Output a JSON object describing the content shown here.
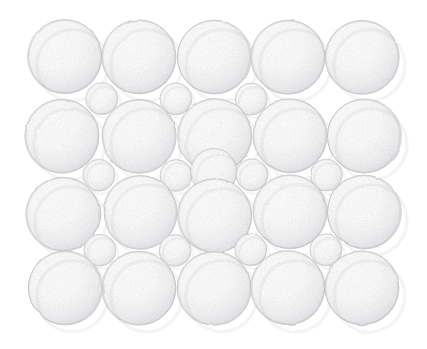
{
  "figure": {
    "medium": "pencil sketch",
    "background_color": "#ffffff",
    "outline_color": "#b9b9bc",
    "shade_color": "#d9d9dd",
    "highlight_color": "#ffffff",
    "canvas": {
      "width": 427,
      "height": 349
    },
    "pattern_bounds": {
      "x": 28,
      "y": 20,
      "width": 372,
      "height": 305
    }
  },
  "chart_data": {
    "type": "scatter",
    "xlabel": "",
    "ylabel": "",
    "xlim": [
      0,
      427
    ],
    "ylim": [
      0,
      349
    ],
    "grid": false,
    "legend": "none",
    "size_classes": [
      {
        "name": "large",
        "radius": 37,
        "count": 20
      },
      {
        "name": "medium",
        "radius": 23,
        "count": 1
      },
      {
        "name": "small",
        "radius": 16,
        "count": 11
      }
    ],
    "rows": [
      {
        "index": 1,
        "type": "large",
        "cy": 57,
        "count": 5
      },
      {
        "index": 2,
        "type": "interstitial",
        "cy": 99,
        "count": 3
      },
      {
        "index": 3,
        "type": "large",
        "cy": 136,
        "count": 5
      },
      {
        "index": 4,
        "type": "interstitial",
        "cy": 175,
        "count": 5
      },
      {
        "index": 5,
        "type": "large",
        "cy": 214,
        "count": 5
      },
      {
        "index": 6,
        "type": "interstitial",
        "cy": 250,
        "count": 4
      },
      {
        "index": 7,
        "type": "large",
        "cy": 288,
        "count": 5
      }
    ],
    "columns": {
      "count": 5,
      "centers_x": [
        65,
        139,
        214,
        288,
        362
      ]
    },
    "spheres": [
      {
        "id": "L1-1",
        "cx": 65,
        "cy": 57,
        "r": 37,
        "class": "large"
      },
      {
        "id": "L1-2",
        "cx": 139,
        "cy": 57,
        "r": 37,
        "class": "large"
      },
      {
        "id": "L1-3",
        "cx": 214,
        "cy": 57,
        "r": 37,
        "class": "large"
      },
      {
        "id": "L1-4",
        "cx": 288,
        "cy": 57,
        "r": 37,
        "class": "large"
      },
      {
        "id": "L1-5",
        "cx": 362,
        "cy": 57,
        "r": 37,
        "class": "large"
      },
      {
        "id": "S1-1",
        "cx": 102,
        "cy": 99,
        "r": 16,
        "class": "small"
      },
      {
        "id": "S1-2",
        "cx": 176,
        "cy": 99,
        "r": 16,
        "class": "small"
      },
      {
        "id": "S1-3",
        "cx": 251,
        "cy": 99,
        "r": 16,
        "class": "small"
      },
      {
        "id": "L2-1",
        "cx": 62,
        "cy": 136,
        "r": 37,
        "class": "large"
      },
      {
        "id": "L2-2",
        "cx": 139,
        "cy": 136,
        "r": 37,
        "class": "large"
      },
      {
        "id": "L2-3",
        "cx": 215,
        "cy": 136,
        "r": 37,
        "class": "large"
      },
      {
        "id": "L2-4",
        "cx": 290,
        "cy": 136,
        "r": 37,
        "class": "large"
      },
      {
        "id": "L2-5",
        "cx": 364,
        "cy": 136,
        "r": 37,
        "class": "large"
      },
      {
        "id": "S2-1",
        "cx": 99,
        "cy": 175,
        "r": 16,
        "class": "small"
      },
      {
        "id": "S2-2",
        "cx": 176,
        "cy": 175,
        "r": 16,
        "class": "small"
      },
      {
        "id": "S2-M",
        "cx": 214,
        "cy": 172,
        "r": 23,
        "class": "medium"
      },
      {
        "id": "S2-3",
        "cx": 252,
        "cy": 175,
        "r": 16,
        "class": "small"
      },
      {
        "id": "S2-4",
        "cx": 326,
        "cy": 175,
        "r": 16,
        "class": "small"
      },
      {
        "id": "L3-1",
        "cx": 63,
        "cy": 214,
        "r": 37,
        "class": "large"
      },
      {
        "id": "L3-2",
        "cx": 140,
        "cy": 212,
        "r": 37,
        "class": "large"
      },
      {
        "id": "L3-3",
        "cx": 215,
        "cy": 216,
        "r": 37,
        "class": "large"
      },
      {
        "id": "L3-4",
        "cx": 290,
        "cy": 212,
        "r": 37,
        "class": "large"
      },
      {
        "id": "L3-5",
        "cx": 364,
        "cy": 212,
        "r": 37,
        "class": "large"
      },
      {
        "id": "S3-1",
        "cx": 100,
        "cy": 250,
        "r": 16,
        "class": "small"
      },
      {
        "id": "S3-2",
        "cx": 175,
        "cy": 250,
        "r": 16,
        "class": "small"
      },
      {
        "id": "S3-3",
        "cx": 251,
        "cy": 250,
        "r": 16,
        "class": "small"
      },
      {
        "id": "S3-4",
        "cx": 326,
        "cy": 250,
        "r": 16,
        "class": "small"
      },
      {
        "id": "L4-1",
        "cx": 65,
        "cy": 288,
        "r": 37,
        "class": "large"
      },
      {
        "id": "L4-2",
        "cx": 139,
        "cy": 288,
        "r": 37,
        "class": "large"
      },
      {
        "id": "L4-3",
        "cx": 214,
        "cy": 288,
        "r": 37,
        "class": "large"
      },
      {
        "id": "L4-4",
        "cx": 288,
        "cy": 288,
        "r": 37,
        "class": "large"
      },
      {
        "id": "L4-5",
        "cx": 362,
        "cy": 288,
        "r": 37,
        "class": "large"
      }
    ]
  }
}
